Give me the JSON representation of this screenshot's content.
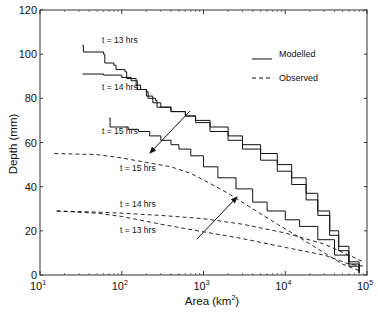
{
  "chart_data": {
    "type": "line",
    "title": "",
    "xlabel": "Area (km²)",
    "xlabel_base": "Area (km",
    "xlabel_sup": "2",
    "xlabel_tail": ")",
    "ylabel": "Depth (mm)",
    "xscale": "log",
    "xlim": [
      10,
      100000
    ],
    "ylim": [
      0,
      120
    ],
    "grid": false,
    "x_ticks": [
      {
        "base": "10",
        "exp": "1",
        "value": 10
      },
      {
        "base": "10",
        "exp": "2",
        "value": 100
      },
      {
        "base": "10",
        "exp": "3",
        "value": 1000
      },
      {
        "base": "10",
        "exp": "4",
        "value": 10000
      },
      {
        "base": "10",
        "exp": "5",
        "value": 100000
      }
    ],
    "y_ticks": [
      {
        "label": "0",
        "value": 0
      },
      {
        "label": "20",
        "value": 20
      },
      {
        "label": "40",
        "value": 40
      },
      {
        "label": "60",
        "value": 60
      },
      {
        "label": "80",
        "value": 80
      },
      {
        "label": "100",
        "value": 100
      },
      {
        "label": "120",
        "value": 120
      }
    ],
    "legend": {
      "position": "upper right",
      "entries": [
        {
          "label": "Modelled",
          "style": "solid"
        },
        {
          "label": "Observed",
          "style": "dashed"
        }
      ]
    },
    "series": [
      {
        "name": "Modelled t = 13 hrs",
        "style": "solid",
        "label": "t = 13 hrs",
        "points": [
          [
            33,
            104
          ],
          [
            34,
            101
          ],
          [
            60,
            100
          ],
          [
            62,
            96
          ],
          [
            80,
            95
          ],
          [
            85,
            93
          ],
          [
            110,
            92
          ],
          [
            115,
            89
          ],
          [
            150,
            88
          ],
          [
            155,
            84
          ],
          [
            200,
            83
          ],
          [
            210,
            80
          ],
          [
            260,
            79
          ],
          [
            270,
            76
          ],
          [
            400,
            74
          ],
          [
            600,
            72
          ],
          [
            800,
            70
          ],
          [
            1200,
            67
          ],
          [
            2000,
            63
          ],
          [
            3000,
            59
          ],
          [
            5000,
            55
          ],
          [
            8000,
            50
          ],
          [
            12000,
            44
          ],
          [
            18000,
            37
          ],
          [
            25000,
            29
          ],
          [
            35000,
            20
          ],
          [
            45000,
            13
          ],
          [
            60000,
            6
          ],
          [
            80000,
            1
          ]
        ]
      },
      {
        "name": "Modelled t = 14 hrs",
        "style": "solid",
        "label": "t = 14 hrs",
        "points": [
          [
            33,
            91
          ],
          [
            60,
            90.5
          ],
          [
            100,
            89.5
          ],
          [
            130,
            88
          ],
          [
            150,
            86
          ],
          [
            170,
            84
          ],
          [
            200,
            81
          ],
          [
            240,
            78
          ],
          [
            300,
            76
          ],
          [
            400,
            74
          ],
          [
            600,
            72
          ],
          [
            800,
            69
          ],
          [
            1200,
            65
          ],
          [
            2000,
            61
          ],
          [
            3000,
            57
          ],
          [
            5000,
            52
          ],
          [
            8000,
            47
          ],
          [
            12000,
            41
          ],
          [
            18000,
            34
          ],
          [
            25000,
            27
          ],
          [
            35000,
            18
          ],
          [
            45000,
            11
          ],
          [
            60000,
            5
          ],
          [
            80000,
            1
          ]
        ]
      },
      {
        "name": "Modelled t = 15 hrs",
        "style": "solid",
        "label": "t = 15 hrs",
        "points": [
          [
            70,
            71
          ],
          [
            72,
            67
          ],
          [
            120,
            66
          ],
          [
            160,
            65
          ],
          [
            220,
            63
          ],
          [
            300,
            61
          ],
          [
            400,
            59
          ],
          [
            500,
            57
          ],
          [
            700,
            54
          ],
          [
            1000,
            49
          ],
          [
            1500,
            44
          ],
          [
            2500,
            39
          ],
          [
            4000,
            33
          ],
          [
            6000,
            29
          ],
          [
            10000,
            25
          ],
          [
            15000,
            22
          ],
          [
            25000,
            16
          ],
          [
            40000,
            9
          ],
          [
            60000,
            4
          ],
          [
            80000,
            1
          ]
        ]
      },
      {
        "name": "Observed t = 15 hrs",
        "style": "dashed",
        "label": "t = 15 hrs",
        "points": [
          [
            15,
            55
          ],
          [
            50,
            54.5
          ],
          [
            100,
            53
          ],
          [
            200,
            51
          ],
          [
            400,
            49
          ],
          [
            700,
            46
          ],
          [
            1000,
            43
          ],
          [
            2000,
            37
          ],
          [
            4000,
            30
          ],
          [
            8000,
            23
          ],
          [
            15000,
            17
          ],
          [
            30000,
            10
          ],
          [
            50000,
            5
          ],
          [
            80000,
            2
          ]
        ]
      },
      {
        "name": "Observed t = 14 hrs",
        "style": "dashed",
        "label": "t = 14 hrs",
        "points": [
          [
            16,
            29
          ],
          [
            50,
            28.5
          ],
          [
            100,
            28
          ],
          [
            300,
            27
          ],
          [
            1000,
            25.5
          ],
          [
            3000,
            23
          ],
          [
            10000,
            19
          ],
          [
            30000,
            14
          ],
          [
            60000,
            9
          ],
          [
            90000,
            6
          ]
        ]
      },
      {
        "name": "Observed t = 13 hrs",
        "style": "dashed",
        "label": "t = 13 hrs",
        "points": [
          [
            16,
            29
          ],
          [
            50,
            28
          ],
          [
            100,
            26.5
          ],
          [
            300,
            23
          ],
          [
            1000,
            19.5
          ],
          [
            3000,
            16.5
          ],
          [
            10000,
            12.5
          ],
          [
            30000,
            9
          ],
          [
            60000,
            5
          ],
          [
            90000,
            4
          ]
        ]
      }
    ],
    "annotations": [
      {
        "text": "t = 13 hrs",
        "x": 102,
        "y": 43,
        "anchor": "start"
      },
      {
        "text": "t = 14 hrs",
        "x": 102,
        "y": 90,
        "anchor": "start"
      },
      {
        "text": "t = 15 hrs",
        "x": 102,
        "y": 134,
        "anchor": "start"
      },
      {
        "text": "t = 15 hrs",
        "x": 120,
        "y": 171,
        "anchor": "start"
      },
      {
        "text": "t = 14 hrs",
        "x": 120,
        "y": 207,
        "anchor": "start"
      },
      {
        "text": "t = 13 hrs",
        "x": 120,
        "y": 233,
        "anchor": "start"
      }
    ],
    "arrows": [
      {
        "from": [
          190,
          111
        ],
        "to": [
          150,
          153
        ]
      },
      {
        "from": [
          197,
          239
        ],
        "to": [
          237,
          197
        ]
      }
    ]
  }
}
